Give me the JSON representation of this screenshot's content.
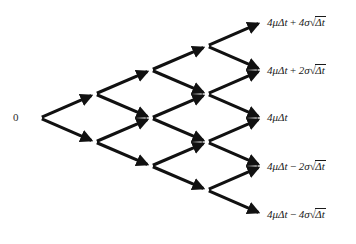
{
  "diagram": {
    "type": "recombining-binomial-lattice",
    "title": "",
    "steps": 4,
    "background_color": "#ffffff",
    "edge_color": "#111111",
    "text_color": "#1a1a1a",
    "root": {
      "label": "0",
      "x": 28,
      "y": 118
    },
    "terminal_nodes": [
      {
        "id": "uuuu",
        "x": 262,
        "y": 22,
        "label": "4μΔt + 4σ√Δt",
        "drift": "4μΔt",
        "operator": "+",
        "diffusion_coeff": "4σ",
        "radicand": "Δt",
        "label_x": 267,
        "label_y": 22
      },
      {
        "id": "uuud",
        "x": 262,
        "y": 70,
        "label": "4μΔt + 2σ√Δt",
        "drift": "4μΔt",
        "operator": "+",
        "diffusion_coeff": "2σ",
        "radicand": "Δt",
        "label_x": 267,
        "label_y": 70
      },
      {
        "id": "uudd",
        "x": 262,
        "y": 118,
        "label": "4μΔt",
        "drift": "4μΔt",
        "operator": "",
        "diffusion_coeff": "",
        "radicand": "",
        "label_x": 267,
        "label_y": 118
      },
      {
        "id": "uddd",
        "x": 262,
        "y": 166,
        "label": "4μΔt − 2σ√Δt",
        "drift": "4μΔt",
        "operator": "−",
        "diffusion_coeff": "2σ",
        "radicand": "Δt",
        "label_x": 267,
        "label_y": 166
      },
      {
        "id": "dddd",
        "x": 262,
        "y": 214,
        "label": "4μΔt − 4σ√Δt",
        "drift": "4μΔt",
        "operator": "−",
        "diffusion_coeff": "4σ",
        "radicand": "Δt",
        "label_x": 267,
        "label_y": 214
      }
    ],
    "lattice_nodes": [
      {
        "id": "n0-0",
        "level": 0,
        "x": 40,
        "y": 118
      },
      {
        "id": "n1-0",
        "level": 1,
        "x": 95,
        "y": 94
      },
      {
        "id": "n1-1",
        "level": 1,
        "x": 95,
        "y": 142
      },
      {
        "id": "n2-0",
        "level": 2,
        "x": 151,
        "y": 70
      },
      {
        "id": "n2-1",
        "level": 2,
        "x": 151,
        "y": 118
      },
      {
        "id": "n2-2",
        "level": 2,
        "x": 151,
        "y": 166
      },
      {
        "id": "n3-0",
        "level": 3,
        "x": 207,
        "y": 46
      },
      {
        "id": "n3-1",
        "level": 3,
        "x": 207,
        "y": 94
      },
      {
        "id": "n3-2",
        "level": 3,
        "x": 207,
        "y": 142
      },
      {
        "id": "n3-3",
        "level": 3,
        "x": 207,
        "y": 190
      },
      {
        "id": "n4-0",
        "level": 4,
        "x": 262,
        "y": 22
      },
      {
        "id": "n4-1",
        "level": 4,
        "x": 262,
        "y": 70
      },
      {
        "id": "n4-2",
        "level": 4,
        "x": 262,
        "y": 118
      },
      {
        "id": "n4-3",
        "level": 4,
        "x": 262,
        "y": 166
      },
      {
        "id": "n4-4",
        "level": 4,
        "x": 262,
        "y": 214
      }
    ],
    "edges": [
      {
        "from": "n0-0",
        "to": "n1-0",
        "direction": "up"
      },
      {
        "from": "n0-0",
        "to": "n1-1",
        "direction": "down"
      },
      {
        "from": "n1-0",
        "to": "n2-0",
        "direction": "up"
      },
      {
        "from": "n1-0",
        "to": "n2-1",
        "direction": "down"
      },
      {
        "from": "n1-1",
        "to": "n2-1",
        "direction": "up"
      },
      {
        "from": "n1-1",
        "to": "n2-2",
        "direction": "down"
      },
      {
        "from": "n2-0",
        "to": "n3-0",
        "direction": "up"
      },
      {
        "from": "n2-0",
        "to": "n3-1",
        "direction": "down"
      },
      {
        "from": "n2-1",
        "to": "n3-1",
        "direction": "up"
      },
      {
        "from": "n2-1",
        "to": "n3-2",
        "direction": "down"
      },
      {
        "from": "n2-2",
        "to": "n3-2",
        "direction": "up"
      },
      {
        "from": "n2-2",
        "to": "n3-3",
        "direction": "down"
      },
      {
        "from": "n3-0",
        "to": "n4-0",
        "direction": "up"
      },
      {
        "from": "n3-0",
        "to": "n4-1",
        "direction": "down"
      },
      {
        "from": "n3-1",
        "to": "n4-1",
        "direction": "up"
      },
      {
        "from": "n3-1",
        "to": "n4-2",
        "direction": "down"
      },
      {
        "from": "n3-2",
        "to": "n4-2",
        "direction": "up"
      },
      {
        "from": "n3-2",
        "to": "n4-3",
        "direction": "down"
      },
      {
        "from": "n3-3",
        "to": "n4-3",
        "direction": "up"
      },
      {
        "from": "n3-3",
        "to": "n4-4",
        "direction": "down"
      }
    ]
  }
}
